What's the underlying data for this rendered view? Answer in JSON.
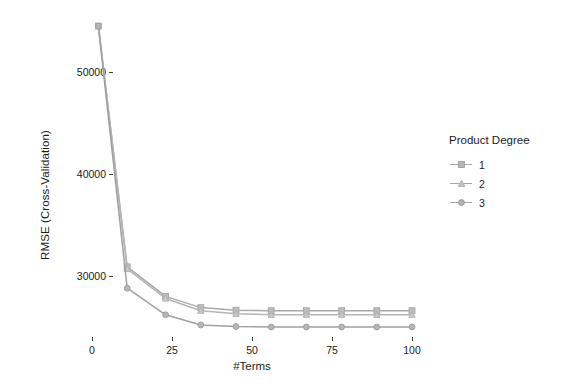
{
  "chart_data": {
    "type": "line",
    "title": "",
    "subtitle": "",
    "xlabel": "#Terms",
    "ylabel": "RMSE (Cross-Validation)",
    "xlim": [
      -3,
      108
    ],
    "ylim": [
      24000,
      56000
    ],
    "xticks": [
      0,
      25,
      50,
      75,
      100
    ],
    "xticklabels": [
      "0",
      "25",
      "50",
      "75",
      "100"
    ],
    "yticks": [
      30000,
      40000,
      50000
    ],
    "yticklabels": [
      "30000",
      "40000",
      "50000"
    ],
    "grid": false,
    "legend_position": "right",
    "legend_title": "Product Degree",
    "x": [
      2,
      11,
      23,
      34,
      45,
      56,
      67,
      78,
      89,
      100
    ],
    "series": [
      {
        "name": "1",
        "marker": "square",
        "color": "#a9a9a9",
        "values": [
          54500,
          30900,
          28000,
          26900,
          26650,
          26600,
          26600,
          26600,
          26600,
          26600
        ]
      },
      {
        "name": "2",
        "marker": "triangle",
        "color": "#b4b4b4",
        "values": [
          54500,
          30700,
          27800,
          26600,
          26300,
          26200,
          26200,
          26200,
          26200,
          26200
        ]
      },
      {
        "name": "3",
        "marker": "circle",
        "color": "#a0a0a0",
        "values": [
          54500,
          28800,
          26200,
          25200,
          25050,
          25000,
          25000,
          25000,
          25000,
          25000
        ]
      }
    ]
  },
  "legend": {
    "title": "Product Degree",
    "items": [
      {
        "label": "1"
      },
      {
        "label": "2"
      },
      {
        "label": "3"
      }
    ]
  },
  "axes": {
    "y_title": "RMSE (Cross-Validation)",
    "x_title": "#Terms",
    "y_tick_labels": [
      "50000",
      "40000",
      "30000"
    ],
    "x_tick_labels": [
      "0",
      "25",
      "50",
      "75",
      "100"
    ]
  },
  "colors": {
    "background": "#ffffff",
    "axis_text": "#1a1a1a",
    "tick_mark": "#3d3d3d",
    "series_1": "#a9a9a9",
    "series_2": "#b4b4b4",
    "series_3": "#a0a0a0"
  }
}
